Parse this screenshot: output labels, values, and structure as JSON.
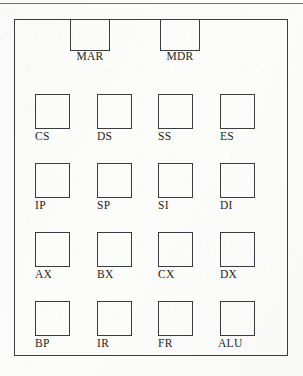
{
  "diagram": {
    "line_color": "#3b3c3f",
    "text_color": "#1d1e20",
    "background_color": "#fcfcfb",
    "page_rule_color": "#6f7073",
    "top_registers": [
      {
        "label": "MAR",
        "name": "memory-address-register"
      },
      {
        "label": "MDR",
        "name": "memory-data-register"
      }
    ],
    "rows": [
      {
        "name": "segment-registers",
        "cells": [
          {
            "label": "CS"
          },
          {
            "label": "DS"
          },
          {
            "label": "SS"
          },
          {
            "label": "ES"
          }
        ]
      },
      {
        "name": "pointer-and-index-registers",
        "cells": [
          {
            "label": "IP"
          },
          {
            "label": "SP"
          },
          {
            "label": "SI"
          },
          {
            "label": "DI"
          }
        ]
      },
      {
        "name": "general-purpose-registers",
        "cells": [
          {
            "label": "AX"
          },
          {
            "label": "BX"
          },
          {
            "label": "CX"
          },
          {
            "label": "DX"
          }
        ]
      },
      {
        "name": "misc-registers-and-alu",
        "cells": [
          {
            "label": "BP"
          },
          {
            "label": "IR"
          },
          {
            "label": "FR"
          },
          {
            "label": "ALU"
          }
        ]
      }
    ]
  }
}
